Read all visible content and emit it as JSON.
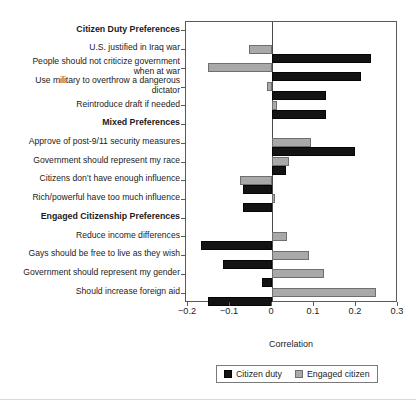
{
  "chart_data": {
    "type": "bar",
    "orientation": "horizontal",
    "title": "",
    "xlabel": "Correlation",
    "ylabel": "",
    "xlim": [
      -0.2,
      0.3
    ],
    "xticks": [
      -0.2,
      -0.1,
      0,
      0.1,
      0.2,
      0.3
    ],
    "xticklabels": [
      "−0.2",
      "−0.1",
      "0",
      "0.1",
      "0.2",
      "0.3"
    ],
    "grid": false,
    "legend_position": "below-axis-center",
    "groups": [
      {
        "name": "Citizen Duty Preferences",
        "categories": [
          "U.S. justified in Iraq war",
          "People should not criticize government when at war",
          "Use military to overthrow a dangerous dictator",
          "Reintroduce draft if needed"
        ]
      },
      {
        "name": "Mixed Preferences",
        "categories": [
          "Approve of post-9/11 security measures",
          "Government should represent my race",
          "Citizens don’t have enough influence",
          "Rich/powerful have too much influence"
        ]
      },
      {
        "name": "Engaged Citizenship Preferences",
        "categories": [
          "Reduce income differences",
          "Gays should be free to live as they wish",
          "Government should represent my gender",
          "Should increase foreign aid"
        ]
      }
    ],
    "categories": [
      "U.S. justified in Iraq war",
      "People should not criticize government when at war",
      "Use military to overthrow a dangerous dictator",
      "Reintroduce draft if needed",
      "Approve of post-9/11 security measures",
      "Government should represent my race",
      "Citizens don’t have enough influence",
      "Rich/powerful have too much influence",
      "Reduce income differences",
      "Gays should be free to live as they wish",
      "Government should represent my gender",
      "Should increase foreign aid"
    ],
    "series": [
      {
        "name": "Citizen duty",
        "color": "#131313",
        "values": [
          0.235,
          0.212,
          0.128,
          0.128,
          0.198,
          0.034,
          -0.069,
          -0.069,
          -0.169,
          -0.117,
          -0.024,
          -0.152
        ]
      },
      {
        "name": "Engaged citizen",
        "color": "#a9a9a9",
        "values": [
          -0.055,
          -0.152,
          -0.012,
          0.012,
          0.093,
          0.04,
          -0.076,
          0.008,
          0.036,
          0.088,
          0.123,
          0.247
        ]
      }
    ]
  },
  "axis": {
    "x_title": "Correlation"
  },
  "legend": {
    "items": [
      {
        "label": "Citizen duty",
        "key": "duty"
      },
      {
        "label": "Engaged citizen",
        "key": "engaged"
      }
    ]
  },
  "y_rows": [
    {
      "type": "header",
      "text": "Citizen Duty Preferences"
    },
    {
      "type": "label",
      "text": "U.S. justified in Iraq war"
    },
    {
      "type": "label",
      "text": "People should not criticize government\nwhen at war"
    },
    {
      "type": "label",
      "text": "Use military to overthrow a dangerous\ndictator"
    },
    {
      "type": "label",
      "text": "Reintroduce draft if needed"
    },
    {
      "type": "header",
      "text": "Mixed Preferences"
    },
    {
      "type": "label",
      "text": "Approve of post-9/11 security measures"
    },
    {
      "type": "label",
      "text": "Government should represent my race"
    },
    {
      "type": "label",
      "text": "Citizens don’t have enough influence"
    },
    {
      "type": "label",
      "text": "Rich/powerful have too much influence"
    },
    {
      "type": "header",
      "text": "Engaged Citizenship Preferences"
    },
    {
      "type": "label",
      "text": "Reduce income differences"
    },
    {
      "type": "label",
      "text": "Gays should be free to live as they wish"
    },
    {
      "type": "label",
      "text": "Government should represent my gender"
    },
    {
      "type": "label",
      "text": "Should increase foreign aid"
    }
  ]
}
